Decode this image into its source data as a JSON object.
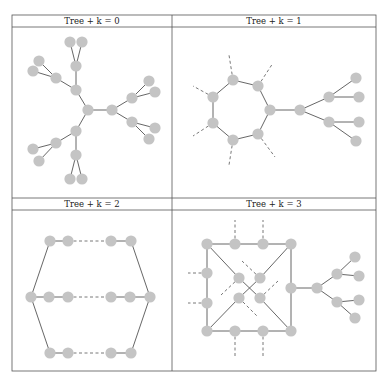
{
  "figure": {
    "panels": [
      {
        "title": "Tree + k = 0",
        "nodes": [
          [
            70,
            42
          ],
          [
            82,
            42
          ],
          [
            39,
            61
          ],
          [
            33,
            71
          ],
          [
            76,
            66
          ],
          [
            56,
            78
          ],
          [
            76,
            90
          ],
          [
            88,
            110
          ],
          [
            112,
            110
          ],
          [
            149,
            81
          ],
          [
            155,
            92
          ],
          [
            132,
            98
          ],
          [
            132,
            122
          ],
          [
            155,
            128
          ],
          [
            149,
            139
          ],
          [
            76,
            131
          ],
          [
            56,
            143
          ],
          [
            33,
            149
          ],
          [
            39,
            161
          ],
          [
            76,
            155
          ],
          [
            70,
            179
          ],
          [
            82,
            179
          ]
        ],
        "edges": [
          [
            0,
            4
          ],
          [
            1,
            4
          ],
          [
            4,
            6
          ],
          [
            2,
            5
          ],
          [
            3,
            5
          ],
          [
            5,
            6
          ],
          [
            6,
            7
          ],
          [
            7,
            8
          ],
          [
            8,
            11
          ],
          [
            8,
            12
          ],
          [
            11,
            9
          ],
          [
            11,
            10
          ],
          [
            12,
            13
          ],
          [
            12,
            14
          ],
          [
            7,
            15
          ],
          [
            15,
            16
          ],
          [
            16,
            17
          ],
          [
            16,
            18
          ],
          [
            15,
            19
          ],
          [
            19,
            20
          ],
          [
            19,
            21
          ]
        ],
        "dashed": []
      },
      {
        "title": "Tree + k = 1",
        "nodes": [
          [
            233,
            80
          ],
          [
            258,
            86
          ],
          [
            270,
            110
          ],
          [
            258,
            134
          ],
          [
            233,
            140
          ],
          [
            213,
            123
          ],
          [
            213,
            97
          ],
          [
            300,
            110
          ],
          [
            329,
            97
          ],
          [
            329,
            122
          ],
          [
            356,
            78
          ],
          [
            359,
            97
          ],
          [
            359,
            122
          ],
          [
            356,
            141
          ]
        ],
        "edges": [
          [
            0,
            1
          ],
          [
            1,
            2
          ],
          [
            2,
            3
          ],
          [
            3,
            4
          ],
          [
            4,
            5
          ],
          [
            5,
            6
          ],
          [
            6,
            0
          ],
          [
            2,
            7
          ],
          [
            7,
            8
          ],
          [
            7,
            9
          ],
          [
            8,
            10
          ],
          [
            8,
            11
          ],
          [
            9,
            12
          ],
          [
            9,
            13
          ]
        ],
        "dashed": [
          [
            233,
            80,
            229,
            55
          ],
          [
            258,
            86,
            273,
            63
          ],
          [
            258,
            134,
            275,
            157
          ],
          [
            233,
            140,
            229,
            165
          ],
          [
            213,
            123,
            193,
            136
          ],
          [
            213,
            97,
            193,
            86
          ]
        ]
      },
      {
        "title": "Tree + k = 2",
        "nodes": [
          [
            50,
            241
          ],
          [
            68,
            241
          ],
          [
            111,
            241
          ],
          [
            131,
            241
          ],
          [
            31,
            297
          ],
          [
            49,
            297
          ],
          [
            68,
            297
          ],
          [
            111,
            297
          ],
          [
            130,
            297
          ],
          [
            150,
            297
          ],
          [
            50,
            353
          ],
          [
            68,
            353
          ],
          [
            111,
            353
          ],
          [
            131,
            353
          ]
        ],
        "edges": [
          [
            0,
            1
          ],
          [
            2,
            3
          ],
          [
            4,
            5
          ],
          [
            5,
            6
          ],
          [
            7,
            8
          ],
          [
            8,
            9
          ],
          [
            10,
            11
          ],
          [
            12,
            13
          ],
          [
            0,
            4
          ],
          [
            4,
            10
          ],
          [
            3,
            9
          ],
          [
            9,
            13
          ]
        ],
        "dashed": [
          [
            68,
            241,
            111,
            241
          ],
          [
            68,
            297,
            111,
            297
          ],
          [
            68,
            353,
            111,
            353
          ]
        ]
      },
      {
        "title": "Tree + k = 3",
        "nodes": [
          [
            207,
            244
          ],
          [
            235,
            244
          ],
          [
            263,
            244
          ],
          [
            291,
            244
          ],
          [
            207,
            273
          ],
          [
            207,
            303
          ],
          [
            207,
            331
          ],
          [
            235,
            331
          ],
          [
            263,
            331
          ],
          [
            291,
            331
          ],
          [
            239,
            278
          ],
          [
            260,
            278
          ],
          [
            239,
            298
          ],
          [
            260,
            298
          ],
          [
            291,
            288
          ],
          [
            317,
            288
          ],
          [
            337,
            274
          ],
          [
            337,
            302
          ],
          [
            355,
            257
          ],
          [
            359,
            276
          ],
          [
            359,
            300
          ],
          [
            355,
            318
          ]
        ],
        "edges": [
          [
            0,
            1
          ],
          [
            1,
            2
          ],
          [
            2,
            3
          ],
          [
            0,
            4
          ],
          [
            4,
            5
          ],
          [
            5,
            6
          ],
          [
            6,
            7
          ],
          [
            7,
            8
          ],
          [
            8,
            9
          ],
          [
            3,
            14
          ],
          [
            14,
            9
          ],
          [
            0,
            10
          ],
          [
            10,
            13
          ],
          [
            13,
            9
          ],
          [
            3,
            11
          ],
          [
            11,
            12
          ],
          [
            12,
            6
          ],
          [
            14,
            15
          ],
          [
            15,
            16
          ],
          [
            15,
            17
          ],
          [
            16,
            18
          ],
          [
            16,
            19
          ],
          [
            17,
            20
          ],
          [
            17,
            21
          ]
        ],
        "dashed": [
          [
            235,
            244,
            235,
            220
          ],
          [
            263,
            244,
            263,
            220
          ],
          [
            235,
            331,
            235,
            356
          ],
          [
            263,
            331,
            263,
            356
          ],
          [
            207,
            273,
            188,
            273
          ],
          [
            207,
            303,
            188,
            303
          ],
          [
            260,
            278,
            242,
            261
          ],
          [
            239,
            278,
            221,
            295
          ],
          [
            260,
            298,
            278,
            281
          ],
          [
            239,
            298,
            257,
            316
          ]
        ]
      }
    ]
  }
}
